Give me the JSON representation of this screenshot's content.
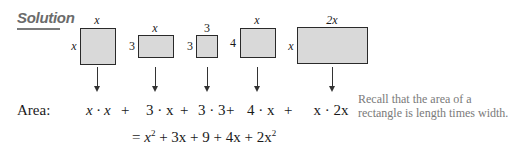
{
  "heading": "Solution",
  "rectangles": [
    {
      "top_label": "x",
      "side_label": "x"
    },
    {
      "top_label": "x",
      "side_label": "3"
    },
    {
      "top_label": "3",
      "side_label": "3"
    },
    {
      "top_label": "x",
      "side_label": "4"
    },
    {
      "top_label": "2x",
      "side_label": "x"
    }
  ],
  "area_row": {
    "label": "Area:",
    "terms": [
      "x · x",
      "3 · x",
      "3 · 3",
      "4 · x",
      "x · 2x"
    ],
    "plus": "+"
  },
  "result_row": {
    "equals": "=",
    "parts": [
      "x",
      "2",
      "+ 3x + 9 + 4x + 2x",
      "2"
    ]
  },
  "note": {
    "line1": "Recall that the area of a",
    "line2": "rectangle is length times width."
  }
}
